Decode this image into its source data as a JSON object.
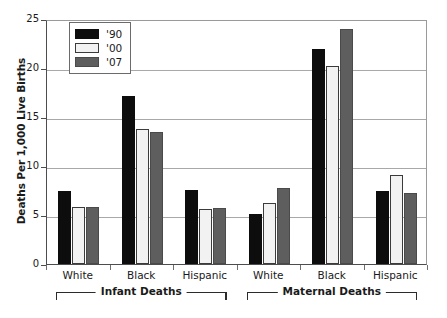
{
  "chart_data": {
    "type": "bar",
    "title": "",
    "xlabel": "",
    "ylabel": "Deaths Per 1,000 Live Births",
    "ylim": [
      0,
      25
    ],
    "yticks": [
      "0",
      "5",
      "10",
      "15",
      "20",
      "25"
    ],
    "grid": true,
    "legend_position": "top-left",
    "categories": [
      "White",
      "Black",
      "Hispanic",
      "White",
      "Black",
      "Hispanic"
    ],
    "group_labels": [
      "Infant Deaths",
      "Maternal Deaths"
    ],
    "series": [
      {
        "name": "'90",
        "color": "#0d0d0d",
        "values": [
          7.5,
          17.1,
          7.6,
          5.1,
          21.9,
          7.5
        ]
      },
      {
        "name": "'00",
        "color": "#f2f2f2",
        "values": [
          5.8,
          13.8,
          5.6,
          6.2,
          20.2,
          9.1
        ]
      },
      {
        "name": "'07",
        "color": "#5e5e5e",
        "values": [
          5.8,
          13.5,
          5.7,
          7.8,
          24.0,
          7.2
        ]
      }
    ]
  },
  "legend": {
    "items": [
      {
        "label": "'90"
      },
      {
        "label": "'00"
      },
      {
        "label": "'07"
      }
    ]
  },
  "axis": {
    "y_title": "Deaths Per 1,000 Live Births"
  }
}
